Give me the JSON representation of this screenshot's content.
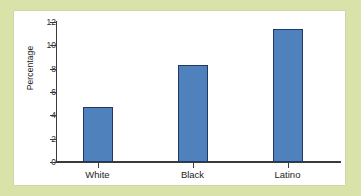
{
  "figure": {
    "page_background": "#d9e3a9",
    "plot_background": "#ffffff",
    "bar_color": "#4f81bd",
    "bar_border_color": "#1f3864",
    "axis_color": "#3a3a3a"
  },
  "chart_data": {
    "type": "bar",
    "title": "",
    "subtitle": "",
    "xlabel": "",
    "ylabel": "Percentage",
    "categories": [
      "White",
      "Black",
      "Latino"
    ],
    "values": [
      4.7,
      8.3,
      11.4
    ],
    "series": [
      {
        "name": "Percentage",
        "values": [
          4.7,
          8.3,
          11.4
        ]
      }
    ],
    "ylim": [
      0,
      12
    ],
    "yticks": [
      0,
      2,
      4,
      6,
      8,
      10,
      12
    ],
    "ytick_labels": [
      "0",
      "2",
      "4",
      "6",
      "8",
      "10",
      "12"
    ],
    "grid": false,
    "legend": null,
    "legend_position": "none",
    "annotations": []
  }
}
